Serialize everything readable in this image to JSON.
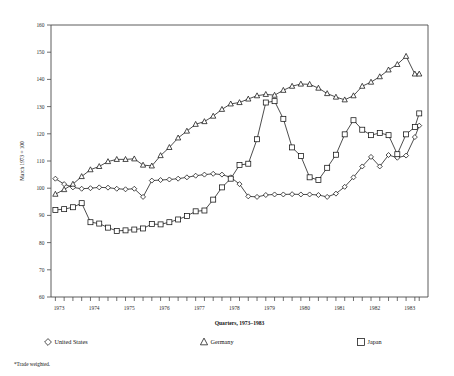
{
  "chart_data": {
    "type": "line",
    "title": "",
    "subtitle": "",
    "xlabel": "Quarters, 1973–1983",
    "ylabel": "March 1973 = 100",
    "footnote": "*Trade weighted.",
    "grid": false,
    "legend_position": "bottom",
    "xlim": [
      1972.75,
      1983.5
    ],
    "ylim": [
      60,
      160
    ],
    "yticks": [
      60,
      70,
      80,
      90,
      100,
      110,
      120,
      130,
      140,
      150,
      160
    ],
    "ytick_labels": [
      "60",
      "70",
      "80",
      "90",
      "100",
      "110",
      "120",
      "130",
      "140",
      "150",
      "160"
    ],
    "xticks": [
      1973,
      1974,
      1975,
      1976,
      1977,
      1978,
      1979,
      1980,
      1981,
      1982,
      1983
    ],
    "xtick_labels": [
      "1973",
      "1974",
      "1975",
      "1976",
      "1977",
      "1978",
      "1979",
      "1980",
      "1981",
      "1982",
      "1983"
    ],
    "x": [
      1972.875,
      1973.125,
      1973.375,
      1973.625,
      1973.875,
      1974.125,
      1974.375,
      1974.625,
      1974.875,
      1975.125,
      1975.375,
      1975.625,
      1975.875,
      1976.125,
      1976.375,
      1976.625,
      1976.875,
      1977.125,
      1977.375,
      1977.625,
      1977.875,
      1978.125,
      1978.375,
      1978.625,
      1978.875,
      1979.125,
      1979.375,
      1979.625,
      1979.875,
      1980.125,
      1980.375,
      1980.625,
      1980.875,
      1981.125,
      1981.375,
      1981.625,
      1981.875,
      1982.125,
      1982.375,
      1982.625,
      1982.875,
      1983.125,
      1983.25
    ],
    "x_quarter_labels": [
      "1972 Q4",
      "1973 Q1",
      "1973 Q2",
      "1973 Q3",
      "1973 Q4",
      "1974 Q1",
      "1974 Q2",
      "1974 Q3",
      "1974 Q4",
      "1975 Q1",
      "1975 Q2",
      "1975 Q3",
      "1975 Q4",
      "1976 Q1",
      "1976 Q2",
      "1976 Q3",
      "1976 Q4",
      "1977 Q1",
      "1977 Q2",
      "1977 Q3",
      "1977 Q4",
      "1978 Q1",
      "1978 Q2",
      "1978 Q3",
      "1978 Q4",
      "1979 Q1",
      "1979 Q2",
      "1979 Q3",
      "1979 Q4",
      "1980 Q1",
      "1980 Q2",
      "1980 Q3",
      "1980 Q4",
      "1981 Q1",
      "1981 Q2",
      "1981 Q3",
      "1981 Q4",
      "1982 Q1",
      "1982 Q2",
      "1982 Q3",
      "1982 Q4",
      "1983 Q1",
      "1983 Q2",
      "1983 Q3"
    ],
    "series": [
      {
        "name": "United States",
        "marker": "diamond",
        "values": [
          103.5,
          101.5,
          100.3,
          99.8,
          100.0,
          100.3,
          100.2,
          99.8,
          99.6,
          99.8,
          96.8,
          102.8,
          103.0,
          103.2,
          103.5,
          104.0,
          104.6,
          105.0,
          105.3,
          105.0,
          104.0,
          101.5,
          97.0,
          96.8,
          97.5,
          97.7,
          97.7,
          97.8,
          97.7,
          97.7,
          97.5,
          96.8,
          98.0,
          100.5,
          104.0,
          108.0,
          111.5,
          108.0,
          112.2,
          111.2,
          112.0,
          118.8,
          123.0
        ]
      },
      {
        "name": "Germany",
        "marker": "triangle",
        "values": [
          97.8,
          99.5,
          101.5,
          104.3,
          106.8,
          108.0,
          109.8,
          110.6,
          110.6,
          110.8,
          108.5,
          108.2,
          112.0,
          115.0,
          118.5,
          121.0,
          123.5,
          124.5,
          126.5,
          129.0,
          131.0,
          131.5,
          132.8,
          134.0,
          134.5,
          134.2,
          136.0,
          137.5,
          138.3,
          138.2,
          136.8,
          134.8,
          133.5,
          132.5,
          134.0,
          137.5,
          139.0,
          141.0,
          143.5,
          145.5,
          148.5,
          142.0,
          142.0
        ]
      },
      {
        "name": "Japan",
        "marker": "square",
        "values": [
          92.0,
          92.3,
          93.0,
          94.5,
          87.5,
          87.0,
          85.5,
          84.3,
          84.5,
          84.8,
          85.2,
          86.8,
          86.7,
          87.5,
          88.5,
          89.8,
          91.5,
          91.8,
          95.8,
          100.3,
          103.5,
          108.5,
          109.0,
          118.0,
          131.5,
          132.0,
          125.5,
          115.0,
          111.8,
          104.0,
          103.0,
          107.5,
          112.3,
          119.8,
          125.0,
          121.5,
          119.5,
          120.3,
          119.5,
          112.5,
          119.8,
          122.5,
          127.5
        ]
      }
    ],
    "legend": [
      {
        "label": "United States",
        "marker": "diamond"
      },
      {
        "label": "Germany",
        "marker": "triangle"
      },
      {
        "label": "Japan",
        "marker": "square"
      }
    ]
  }
}
